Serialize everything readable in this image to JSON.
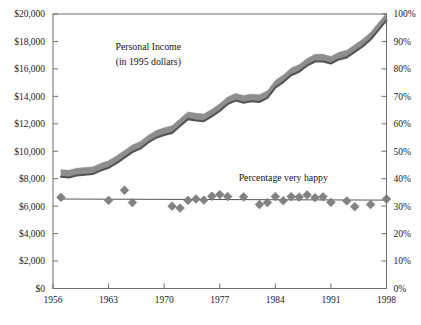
{
  "chart_data": {
    "type": "line",
    "title": "",
    "subtitle": "",
    "xlabel": "",
    "ylabel": "Personal Income (in 1995 dollars)",
    "ylabel_right": "Percentage very happy",
    "xlim": [
      1956,
      1998
    ],
    "ylim_left": [
      0,
      20000
    ],
    "ylim_right": [
      0,
      100
    ],
    "grid": false,
    "legend_position": "inline-annotations",
    "annotations": [
      {
        "text": "Personal Income",
        "x": 1968,
        "y_left": 17400
      },
      {
        "text": "(in 1995 dollars)",
        "x": 1968,
        "y_left": 16300
      },
      {
        "text": "Percentage very happy",
        "x": 1985,
        "y_right": 39
      }
    ],
    "xticks": [
      1956,
      1963,
      1970,
      1977,
      1984,
      1991,
      1998
    ],
    "xticklabels": [
      "1956",
      "1963",
      "1970",
      "1977",
      "1984",
      "1991",
      "1998"
    ],
    "yticks_left": [
      0,
      2000,
      4000,
      6000,
      8000,
      10000,
      12000,
      14000,
      16000,
      18000,
      20000
    ],
    "yticklabels_left": [
      "$0",
      "$2,000",
      "$4,000",
      "$6,000",
      "$8,000",
      "$10,000",
      "$12,000",
      "$14,000",
      "$16,000",
      "$18,000",
      "$20,000"
    ],
    "yticks_right": [
      0,
      10,
      20,
      30,
      40,
      50,
      60,
      70,
      80,
      90,
      100
    ],
    "yticklabels_right": [
      "0%",
      "10%",
      "20%",
      "30%",
      "40%",
      "50%",
      "60%",
      "70%",
      "80%",
      "90%",
      "100%"
    ],
    "series": [
      {
        "name": "Personal Income",
        "type": "band",
        "axis": "left",
        "color": "#8d8d8d",
        "edge_color": "#555555",
        "band_width_dollars": 520,
        "x": [
          1957,
          1958,
          1959,
          1960,
          1961,
          1962,
          1963,
          1964,
          1965,
          1966,
          1967,
          1968,
          1969,
          1970,
          1971,
          1972,
          1973,
          1974,
          1975,
          1976,
          1977,
          1978,
          1979,
          1980,
          1981,
          1982,
          1983,
          1984,
          1985,
          1986,
          1987,
          1988,
          1989,
          1990,
          1991,
          1992,
          1993,
          1994,
          1995,
          1996,
          1997,
          1998
        ],
        "values": [
          8400,
          8350,
          8500,
          8550,
          8600,
          8850,
          9050,
          9400,
          9800,
          10200,
          10450,
          10900,
          11250,
          11450,
          11600,
          12100,
          12600,
          12500,
          12450,
          12800,
          13200,
          13700,
          13950,
          13800,
          13900,
          13850,
          14150,
          14900,
          15300,
          15800,
          16050,
          16500,
          16800,
          16800,
          16650,
          16950,
          17100,
          17500,
          17900,
          18400,
          19100,
          19800
        ]
      },
      {
        "name": "Percentage very happy",
        "type": "scatter-with-trend",
        "axis": "right",
        "marker": "diamond",
        "color": "#828282",
        "trend_color": "#555555",
        "trend_start": 32.6,
        "trend_end": 32.2,
        "points": [
          {
            "x": 1957,
            "y": 33.2
          },
          {
            "x": 1963,
            "y": 32.1
          },
          {
            "x": 1965,
            "y": 35.8
          },
          {
            "x": 1966,
            "y": 31.3
          },
          {
            "x": 1971,
            "y": 30.0
          },
          {
            "x": 1972,
            "y": 29.3
          },
          {
            "x": 1973,
            "y": 32.1
          },
          {
            "x": 1974,
            "y": 32.6
          },
          {
            "x": 1975,
            "y": 32.2
          },
          {
            "x": 1976,
            "y": 33.6
          },
          {
            "x": 1977,
            "y": 34.2
          },
          {
            "x": 1978,
            "y": 33.5
          },
          {
            "x": 1980,
            "y": 33.4
          },
          {
            "x": 1982,
            "y": 30.6
          },
          {
            "x": 1983,
            "y": 31.3
          },
          {
            "x": 1984,
            "y": 33.5
          },
          {
            "x": 1985,
            "y": 32.0
          },
          {
            "x": 1986,
            "y": 33.5
          },
          {
            "x": 1987,
            "y": 33.3
          },
          {
            "x": 1988,
            "y": 34.1
          },
          {
            "x": 1989,
            "y": 33.1
          },
          {
            "x": 1990,
            "y": 33.4
          },
          {
            "x": 1991,
            "y": 31.4
          },
          {
            "x": 1993,
            "y": 31.9
          },
          {
            "x": 1994,
            "y": 29.8
          },
          {
            "x": 1996,
            "y": 30.6
          },
          {
            "x": 1998,
            "y": 32.6
          }
        ]
      }
    ]
  }
}
